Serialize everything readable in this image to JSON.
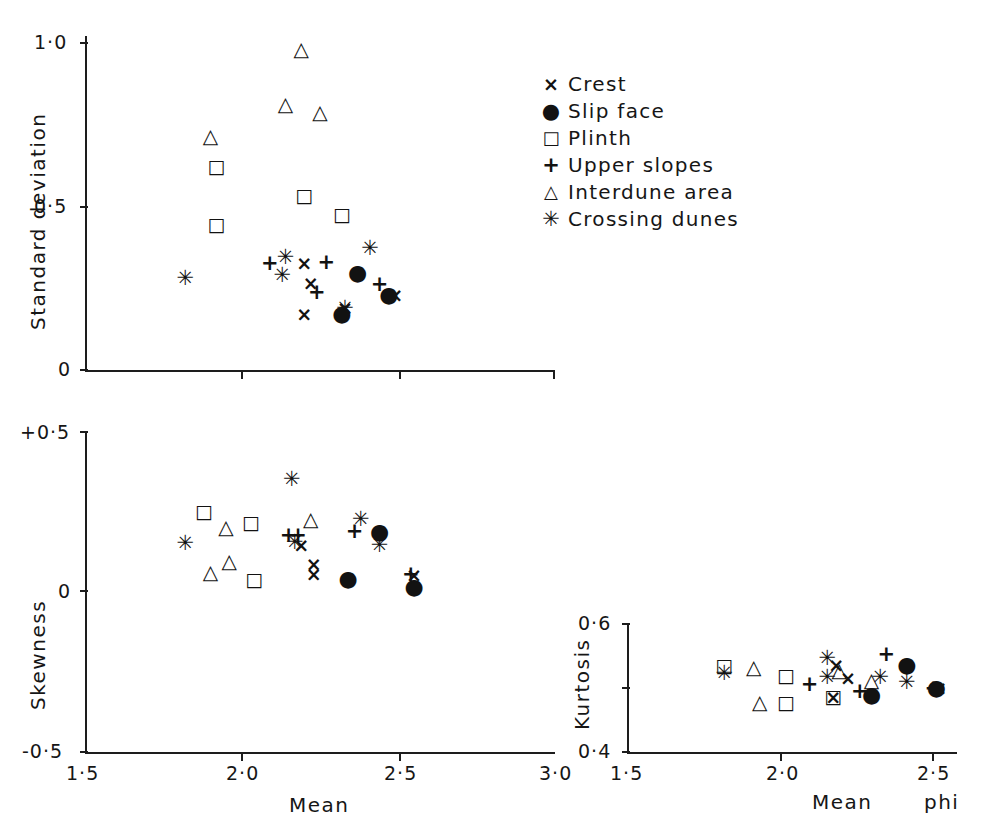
{
  "figure": {
    "style": "scatter",
    "x_axis_unit": "phi"
  },
  "legend": {
    "items": [
      {
        "symbol": "×",
        "sym_class": "s-cross",
        "label": "Crest",
        "key": "crest"
      },
      {
        "symbol": "●",
        "sym_class": "s-dot",
        "label": "Slip  face",
        "key": "slip_face"
      },
      {
        "symbol": "□",
        "sym_class": "s-square",
        "label": "Plinth",
        "key": "plinth"
      },
      {
        "symbol": "+",
        "sym_class": "s-plus",
        "label": "Upper  slopes",
        "key": "upper_slopes"
      },
      {
        "symbol": "△",
        "sym_class": "s-tri",
        "label": "Interdune  area",
        "key": "interdune"
      },
      {
        "symbol": "✳",
        "sym_class": "s-star",
        "label": "Crossing  dunes",
        "key": "crossing_dunes"
      }
    ]
  },
  "chart_data": [
    {
      "id": "panel_sd",
      "type": "scatter",
      "title": "",
      "xlabel": "",
      "ylabel": "Standard  deviation",
      "xlim": [
        1.5,
        3.0
      ],
      "ylim": [
        0.0,
        1.05
      ],
      "xticks": [
        1.5,
        2.0,
        2.5,
        3.0
      ],
      "xticklabels": [
        "",
        "",
        "",
        ""
      ],
      "yticks": [
        0,
        0.5,
        1.0
      ],
      "yticklabels": [
        "0",
        "0·5",
        "1·0"
      ],
      "grid": false,
      "series": [
        {
          "name": "Crest",
          "marker": "×",
          "marker_class": "m-cross",
          "points": [
            [
              2.2,
              0.335
            ],
            [
              2.22,
              0.275
            ],
            [
              2.2,
              0.175
            ],
            [
              2.33,
              0.195
            ],
            [
              2.49,
              0.235
            ]
          ]
        },
        {
          "name": "Slip face",
          "marker": "●",
          "marker_class": "m-dot",
          "points": [
            [
              2.37,
              0.305
            ],
            [
              2.32,
              0.175
            ],
            [
              2.47,
              0.235
            ]
          ]
        },
        {
          "name": "Plinth",
          "marker": "□",
          "marker_class": "m-square",
          "points": [
            [
              1.92,
              0.64
            ],
            [
              1.92,
              0.46
            ],
            [
              2.2,
              0.55
            ],
            [
              2.32,
              0.49
            ]
          ]
        },
        {
          "name": "Upper slopes",
          "marker": "+",
          "marker_class": "m-plus",
          "points": [
            [
              2.09,
              0.335
            ],
            [
              2.27,
              0.34
            ],
            [
              2.24,
              0.245
            ],
            [
              2.44,
              0.27
            ]
          ]
        },
        {
          "name": "Interdune area",
          "marker": "△",
          "marker_class": "m-tri",
          "points": [
            [
              2.19,
              1.01
            ],
            [
              2.14,
              0.835
            ],
            [
              2.25,
              0.81
            ],
            [
              1.9,
              0.735
            ]
          ]
        },
        {
          "name": "Crossing dunes",
          "marker": "✳",
          "marker_class": "m-star",
          "points": [
            [
              1.82,
              0.29
            ],
            [
              2.14,
              0.355
            ],
            [
              2.13,
              0.3
            ],
            [
              2.41,
              0.385
            ],
            [
              2.33,
              0.195
            ]
          ]
        }
      ]
    },
    {
      "id": "panel_skew",
      "type": "scatter",
      "title": "",
      "xlabel": "Mean",
      "ylabel": "Skewness",
      "xlim": [
        1.5,
        3.0
      ],
      "ylim": [
        -0.5,
        0.5
      ],
      "xticks": [
        1.5,
        2.0,
        2.5,
        3.0
      ],
      "xticklabels": [
        "1·5",
        "2·0",
        "2·5",
        "3·0"
      ],
      "yticks": [
        -0.5,
        0,
        0.5
      ],
      "yticklabels": [
        "-0·5",
        "0",
        "+0·5"
      ],
      "grid": false,
      "series": [
        {
          "name": "Crest",
          "marker": "×",
          "marker_class": "m-cross",
          "points": [
            [
              2.19,
              0.145
            ],
            [
              2.23,
              0.085
            ],
            [
              2.23,
              0.055
            ],
            [
              2.55,
              0.05
            ]
          ]
        },
        {
          "name": "Slip face",
          "marker": "●",
          "marker_class": "m-dot",
          "points": [
            [
              2.44,
              0.185
            ],
            [
              2.34,
              0.04
            ],
            [
              2.55,
              0.015
            ]
          ]
        },
        {
          "name": "Plinth",
          "marker": "□",
          "marker_class": "m-square",
          "points": [
            [
              1.88,
              0.25
            ],
            [
              2.03,
              0.215
            ],
            [
              2.04,
              0.04
            ]
          ]
        },
        {
          "name": "Upper slopes",
          "marker": "+",
          "marker_class": "m-plus",
          "points": [
            [
              2.15,
              0.175
            ],
            [
              2.18,
              0.175
            ],
            [
              2.36,
              0.19
            ],
            [
              2.54,
              0.055
            ]
          ]
        },
        {
          "name": "Interdune area",
          "marker": "△",
          "marker_class": "m-tri",
          "points": [
            [
              2.22,
              0.225
            ],
            [
              1.95,
              0.2
            ],
            [
              1.96,
              0.095
            ],
            [
              1.9,
              0.06
            ]
          ]
        },
        {
          "name": "Crossing dunes",
          "marker": "✳",
          "marker_class": "m-star",
          "points": [
            [
              2.16,
              0.35
            ],
            [
              2.38,
              0.225
            ],
            [
              2.44,
              0.145
            ],
            [
              2.17,
              0.155
            ],
            [
              1.82,
              0.15
            ]
          ]
        }
      ]
    },
    {
      "id": "panel_kurt",
      "type": "scatter",
      "title": "",
      "xlabel": "Mean",
      "ylabel": "Kurtosis",
      "xlim": [
        1.5,
        2.62
      ],
      "ylim": [
        0.4,
        0.6
      ],
      "xticks": [
        1.5,
        2.0,
        2.5
      ],
      "xticklabels": [
        "1·5",
        "2·0",
        "2·5"
      ],
      "yticks": [
        0.4,
        0.5,
        0.6
      ],
      "yticklabels": [
        "0·4",
        "",
        "0·6"
      ],
      "grid": false,
      "series": [
        {
          "name": "Crest",
          "marker": "×",
          "marker_class": "m-cross",
          "points": [
            [
              2.21,
              0.535
            ],
            [
              2.25,
              0.515
            ],
            [
              2.2,
              0.485
            ],
            [
              2.56,
              0.5
            ]
          ]
        },
        {
          "name": "Slip face",
          "marker": "●",
          "marker_class": "m-dot",
          "points": [
            [
              2.45,
              0.535
            ],
            [
              2.33,
              0.488
            ],
            [
              2.55,
              0.5
            ]
          ]
        },
        {
          "name": "Plinth",
          "marker": "□",
          "marker_class": "m-square",
          "points": [
            [
              1.83,
              0.535
            ],
            [
              2.04,
              0.52
            ],
            [
              2.04,
              0.478
            ],
            [
              2.2,
              0.487
            ]
          ]
        },
        {
          "name": "Upper slopes",
          "marker": "+",
          "marker_class": "m-plus",
          "points": [
            [
              2.12,
              0.505
            ],
            [
              2.29,
              0.495
            ],
            [
              2.38,
              0.552
            ],
            [
              2.54,
              0.5
            ]
          ]
        },
        {
          "name": "Interdune area",
          "marker": "△",
          "marker_class": "m-tri",
          "points": [
            [
              1.93,
              0.532
            ],
            [
              1.95,
              0.478
            ],
            [
              2.22,
              0.527
            ],
            [
              2.33,
              0.512
            ]
          ]
        },
        {
          "name": "Crossing dunes",
          "marker": "✳",
          "marker_class": "m-star",
          "points": [
            [
              1.83,
              0.523
            ],
            [
              2.18,
              0.545
            ],
            [
              2.18,
              0.517
            ],
            [
              2.36,
              0.517
            ],
            [
              2.45,
              0.508
            ]
          ]
        }
      ]
    }
  ],
  "panel_kurt_extra": {
    "phi_label": "phi"
  }
}
